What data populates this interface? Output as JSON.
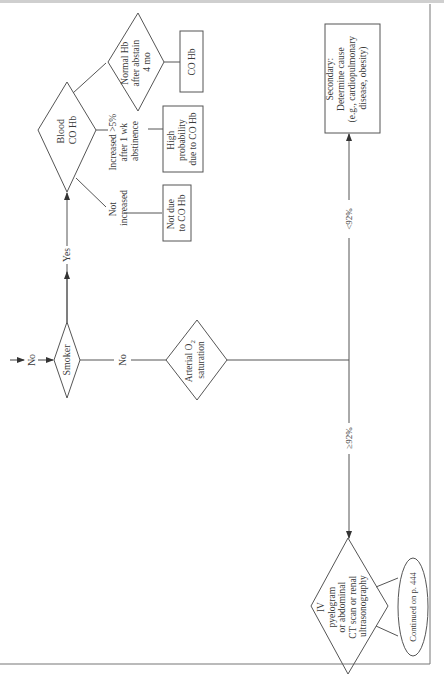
{
  "flowchart": {
    "entry_label": "No",
    "smoker": {
      "label": "Smoker"
    },
    "yes_label": "Yes",
    "no_label": "No",
    "blood_co_hb": {
      "lines": [
        "Blood",
        "CO Hb"
      ]
    },
    "branches": {
      "not_increased": {
        "lines": [
          "Not",
          "increased"
        ]
      },
      "increased": {
        "lines": [
          "Increased >5%",
          "after 1 wk",
          "abstinence"
        ]
      },
      "normal_hb": {
        "lines": [
          "Normal Hb",
          "after abstain",
          "4 mo"
        ]
      }
    },
    "results": {
      "not_due": {
        "lines": [
          "Not due",
          "to CO Hb"
        ]
      },
      "high_probability": {
        "lines": [
          "High",
          "probability",
          "due to CO Hb"
        ]
      },
      "co_hb": {
        "lines": [
          "CO Hb"
        ]
      }
    },
    "arterial_o2": {
      "lines": [
        "Arterial O",
        "2",
        "saturation"
      ]
    },
    "low_sat_label": "<92%",
    "high_sat_label": "≥92%",
    "secondary": {
      "lines": [
        "Secondary:",
        "Determine cause",
        "(e.g., cardiopulmonary",
        "disease, obesity)"
      ]
    },
    "imaging": {
      "lines": [
        "IV",
        "pyelogram",
        "or abdominal",
        "CT scan or renal",
        "ultrasonography"
      ]
    },
    "continued": {
      "label": "Continued on p. 444"
    }
  },
  "colors": {
    "line": "#555555",
    "text": "#3a3a3a",
    "border": "#777777"
  }
}
